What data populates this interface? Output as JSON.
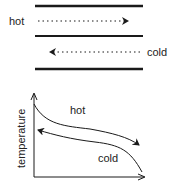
{
  "exchanger": {
    "hot_label": "hot",
    "cold_label": "cold"
  },
  "graph": {
    "y_axis_label": "temperature",
    "hot_curve_label": "hot",
    "cold_curve_label": "cold"
  },
  "colors": {
    "line": "#1a1a1a"
  }
}
